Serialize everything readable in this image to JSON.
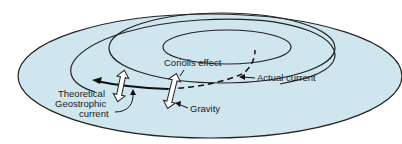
{
  "diagram": {
    "labels": {
      "coriolis": "Coriolis effect",
      "actual": "Actual current",
      "theoretical_line1": "Theoretical",
      "theoretical_line2": "Geostrophic",
      "theoretical_line3": "current",
      "gravity": "Gravity"
    },
    "colors": {
      "water": "#cfe6ee",
      "outline": "#222222"
    }
  }
}
